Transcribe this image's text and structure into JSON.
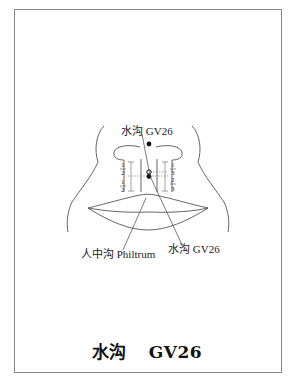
{
  "figure": {
    "labels": {
      "top_point": "水沟 GV26",
      "philtrum": "人中沟 Philtrum",
      "bottom_point": "水沟 GV26"
    },
    "fractions": {
      "left_upper_num": "1",
      "left_upper_den": "2",
      "left_lower_num": "1",
      "left_lower_den": "2",
      "right_upper_num": "1",
      "right_upper_den": "3",
      "right_lower_num": "2",
      "right_lower_den": "3"
    },
    "caption": {
      "chinese": "水沟",
      "code": "GV26"
    }
  }
}
